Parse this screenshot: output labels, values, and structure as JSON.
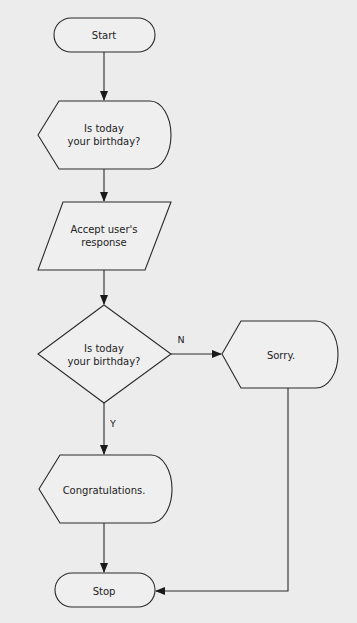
{
  "diagram": {
    "type": "flowchart",
    "background": "#ececec",
    "nodes": [
      {
        "id": "start",
        "shape": "terminator",
        "label": "Start"
      },
      {
        "id": "display1",
        "shape": "display",
        "label": "Is today\nyour birthday?"
      },
      {
        "id": "input",
        "shape": "parallelogram",
        "label": "Accept user's\nresponse"
      },
      {
        "id": "decision",
        "shape": "diamond",
        "label": "Is today\nyour birthday?"
      },
      {
        "id": "sorry",
        "shape": "display",
        "label": "Sorry."
      },
      {
        "id": "congrats",
        "shape": "display",
        "label": "Congratulations."
      },
      {
        "id": "stop",
        "shape": "terminator",
        "label": "Stop"
      }
    ],
    "edges": [
      {
        "from": "start",
        "to": "display1",
        "label": ""
      },
      {
        "from": "display1",
        "to": "input",
        "label": ""
      },
      {
        "from": "input",
        "to": "decision",
        "label": ""
      },
      {
        "from": "decision",
        "to": "sorry",
        "label": "N"
      },
      {
        "from": "decision",
        "to": "congrats",
        "label": "Y"
      },
      {
        "from": "congrats",
        "to": "stop",
        "label": ""
      },
      {
        "from": "sorry",
        "to": "stop",
        "label": ""
      }
    ]
  }
}
